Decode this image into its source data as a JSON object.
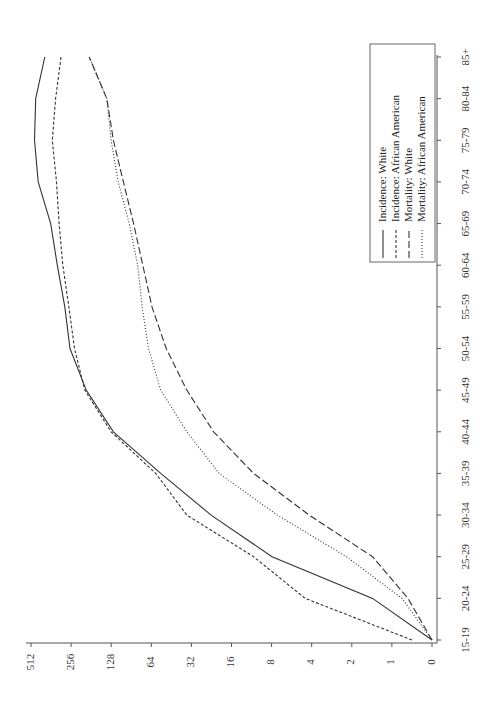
{
  "chart_data": {
    "type": "line",
    "title": "",
    "orientation": "rotated-90-ccw",
    "xlabel": "Age group",
    "ylabel": "Rate (log2 scale)",
    "x": [
      "15-19",
      "20-24",
      "25-29",
      "30-34",
      "35-39",
      "40-44",
      "45-49",
      "50-54",
      "55-59",
      "60-64",
      "65-69",
      "70-74",
      "75-79",
      "80-84",
      "85+"
    ],
    "y_ticks": [
      "0",
      "1",
      "2",
      "4",
      "8",
      "16",
      "32",
      "64",
      "128",
      "256",
      "512"
    ],
    "y_scale": "log2",
    "ylim": [
      0,
      512
    ],
    "grid": false,
    "legend_position": "inside, upper-right of rotated page",
    "series": [
      {
        "name": "Incidence: White",
        "style": "solid",
        "values": [
          0,
          1.4,
          8,
          23,
          55,
          125,
          200,
          265,
          290,
          330,
          370,
          460,
          490,
          480,
          410
        ]
      },
      {
        "name": "Incidence: African American",
        "style": "short-dash",
        "values": [
          0.5,
          4.5,
          11,
          35,
          60,
          130,
          205,
          245,
          270,
          300,
          320,
          335,
          360,
          340,
          310
        ]
      },
      {
        "name": "Mortality: White",
        "style": "long-dash",
        "values": [
          0,
          0.6,
          1.4,
          4.2,
          11,
          22,
          35,
          50,
          64,
          75,
          88,
          105,
          125,
          140,
          190
        ]
      },
      {
        "name": "Mortality: African American",
        "style": "dotted",
        "values": [
          0,
          0.75,
          2.2,
          7.3,
          20,
          35,
          55,
          68,
          76,
          82,
          95,
          115,
          130,
          140,
          190
        ]
      }
    ]
  },
  "legend": {
    "items": [
      {
        "label": "Incidence: White",
        "style": "solid"
      },
      {
        "label": "Incidence: African American",
        "style": "short-dash"
      },
      {
        "label": "Mortality: White",
        "style": "long-dash"
      },
      {
        "label": "Mortality: African American",
        "style": "dotted"
      }
    ]
  },
  "axes": {
    "value_ticks": [
      "512",
      "256",
      "128",
      "64",
      "32",
      "16",
      "8",
      "4",
      "2",
      "1",
      "0"
    ],
    "age_ticks": [
      "15-19",
      "20-24",
      "25-29",
      "30-34",
      "35-39",
      "40-44",
      "45-49",
      "50-54",
      "55-59",
      "60-64",
      "65-69",
      "70-74",
      "75-79",
      "80-84",
      "85+"
    ]
  }
}
